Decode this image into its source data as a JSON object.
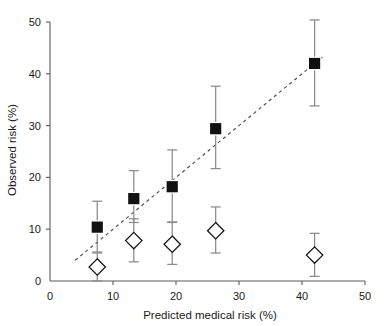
{
  "chart_data": {
    "type": "scatter",
    "title": "",
    "xlabel": "Predicted medical risk (%)",
    "ylabel": "Observed risk (%)",
    "xlim": [
      0,
      50
    ],
    "ylim": [
      0,
      50
    ],
    "xticks": [
      0,
      10,
      20,
      30,
      40,
      50
    ],
    "yticks": [
      0,
      10,
      20,
      30,
      40,
      50
    ],
    "xticklabels": [
      "0",
      "10",
      "20",
      "30",
      "40",
      "50"
    ],
    "yticklabels": [
      "0",
      "10",
      "20",
      "30",
      "40",
      "50"
    ],
    "grid": false,
    "legend": null,
    "annotations": [
      {
        "name": "identity-line",
        "kind": "dashed-reference-line",
        "x0": 4.0,
        "y0": 4.0,
        "x1": 43.5,
        "y1": 43.5
      }
    ],
    "series": [
      {
        "name": "Observed risk (filled squares)",
        "marker": "filled-square",
        "color": "#111111",
        "x": [
          7.5,
          13.3,
          19.4,
          26.3,
          42.0
        ],
        "y": [
          10.4,
          15.9,
          18.2,
          29.4,
          42.0
        ],
        "yerr_low": [
          5.6,
          11.3,
          11.4,
          21.7,
          33.8
        ],
        "yerr_high": [
          15.4,
          21.3,
          25.3,
          37.6,
          50.4
        ]
      },
      {
        "name": "Observed risk (open diamonds)",
        "marker": "open-diamond",
        "color": "#111111",
        "x": [
          7.5,
          13.3,
          19.4,
          26.3,
          42.0
        ],
        "y": [
          2.7,
          7.8,
          7.1,
          9.7,
          5.0
        ],
        "yerr_low": [
          0.0,
          3.7,
          3.2,
          5.4,
          0.9
        ],
        "yerr_high": [
          5.4,
          12.0,
          11.3,
          14.3,
          9.2
        ]
      }
    ]
  },
  "labels": {
    "x_axis_title": "Predicted medical risk (%)",
    "y_axis_title": "Observed risk (%)"
  }
}
